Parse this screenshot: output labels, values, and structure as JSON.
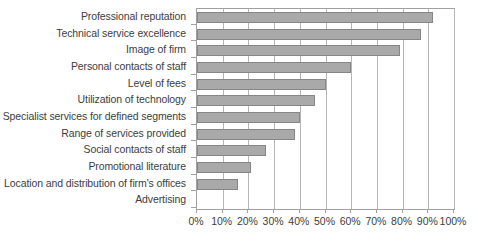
{
  "chart_data": {
    "type": "bar",
    "orientation": "horizontal",
    "title": "",
    "subtitle": "",
    "xlabel": "",
    "ylabel": "",
    "xlim": [
      0,
      100
    ],
    "grid": true,
    "legend": false,
    "legend_position": "none",
    "bar_color": "#a9a9a9",
    "bar_border_color": "#868686",
    "axis_color": "#a0a0a0",
    "gridline_color": "#b5b5b5",
    "text_color": "#3d3d3d",
    "tick_labels": [
      "0%",
      "10%",
      "20%",
      "30%",
      "40%",
      "50%",
      "60%",
      "70%",
      "80%",
      "90%",
      "100%"
    ],
    "tick_values": [
      0,
      10,
      20,
      30,
      40,
      50,
      60,
      70,
      80,
      90,
      100
    ],
    "categories": [
      "Professional reputation",
      "Technical service excellence",
      "Image of firm",
      "Personal contacts of staff",
      "Level of fees",
      "Utilization of technology",
      "Specialist services for defined segments",
      "Range of services provided",
      "Social contacts of staff",
      "Promotional literature",
      "Location and distribution of firm's offices",
      "Advertising"
    ],
    "values": [
      92,
      87,
      79,
      60,
      50,
      46,
      40,
      38,
      27,
      21,
      16,
      0
    ]
  }
}
